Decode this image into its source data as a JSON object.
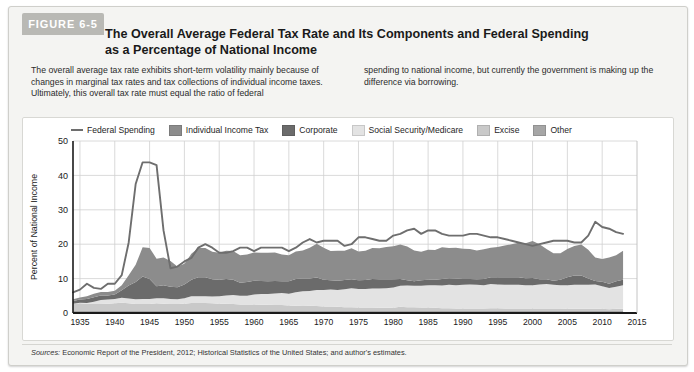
{
  "figure": {
    "tab_label": "FIGURE 6-5",
    "title": "The Overall Average Federal Tax Rate and Its Components and Federal Spending as a Percentage of National Income",
    "blurb_left": "The overall average tax rate exhibits short-term volatility mainly because of changes in marginal tax rates and tax collections of individual income taxes. Ultimately, this overall tax rate must equal the ratio of federal",
    "blurb_right": "spending to national income, but currently the government is making up the difference via borrowing.",
    "source_prefix": "Sources:",
    "source_text": " Economic Report of the President, 2012; Historical Statistics of the United States; and author's estimates."
  },
  "colors": {
    "federal_spending_line": "#6e6e6e",
    "individual_income_tax": "#8c8c8c",
    "corporate": "#6b6b6b",
    "social_security_medicare": "#e3e3e3",
    "excise": "#c9c9c9",
    "other": "#a6a6a6",
    "grid": "#d0d0d0",
    "axis": "#1a1a1a",
    "card_background": "#f4f4f2",
    "tab_background": "#b9b9b5"
  },
  "chart_data": {
    "type": "area",
    "title": "The Overall Average Federal Tax Rate and Its Components and Federal Spending as a Percentage of National Income",
    "xlabel": "",
    "ylabel": "Percent of National Income",
    "xlim": [
      1934,
      2015
    ],
    "ylim": [
      0,
      50
    ],
    "ytick_values": [
      0,
      10,
      20,
      30,
      40,
      50
    ],
    "ytick_labels": [
      "0",
      "10",
      "20",
      "30",
      "40",
      "50"
    ],
    "xtick_values": [
      1935,
      1940,
      1945,
      1950,
      1955,
      1960,
      1965,
      1970,
      1975,
      1980,
      1985,
      1990,
      1995,
      2000,
      2005,
      2010,
      2015
    ],
    "xtick_labels": [
      "1935",
      "1940",
      "1945",
      "1950",
      "1955",
      "1960",
      "1965",
      "1970",
      "1975",
      "1980",
      "1985",
      "1990",
      "1995",
      "2000",
      "2005",
      "2010",
      "2015"
    ],
    "grid": true,
    "legend_position": "top",
    "stacked": true,
    "stack_order": [
      "other",
      "excise",
      "social_security_medicare",
      "corporate",
      "individual_income_tax"
    ],
    "x": [
      1934,
      1935,
      1936,
      1937,
      1938,
      1939,
      1940,
      1941,
      1942,
      1943,
      1944,
      1945,
      1946,
      1947,
      1948,
      1949,
      1950,
      1951,
      1952,
      1953,
      1954,
      1955,
      1956,
      1957,
      1958,
      1959,
      1960,
      1961,
      1962,
      1963,
      1964,
      1965,
      1966,
      1967,
      1968,
      1969,
      1970,
      1971,
      1972,
      1973,
      1974,
      1975,
      1976,
      1977,
      1978,
      1979,
      1980,
      1981,
      1982,
      1983,
      1984,
      1985,
      1986,
      1987,
      1988,
      1989,
      1990,
      1991,
      1992,
      1993,
      1994,
      1995,
      1996,
      1997,
      1998,
      1999,
      2000,
      2001,
      2002,
      2003,
      2004,
      2005,
      2006,
      2007,
      2008,
      2009,
      2010,
      2011,
      2012,
      2013
    ],
    "series": [
      {
        "name": "Federal Spending",
        "kind": "line",
        "color": "#6e6e6e",
        "values": [
          6.0,
          6.8,
          8.5,
          7.3,
          7.0,
          8.5,
          8.5,
          11.0,
          20.5,
          37.5,
          43.8,
          43.8,
          43.0,
          24.0,
          13.0,
          13.5,
          15.0,
          16.0,
          19.0,
          20.0,
          19.0,
          17.5,
          17.5,
          18.0,
          19.0,
          19.0,
          18.0,
          19.0,
          19.0,
          19.0,
          19.0,
          18.0,
          19.0,
          20.5,
          21.5,
          20.5,
          21.0,
          21.0,
          21.0,
          19.5,
          20.0,
          22.0,
          22.0,
          21.5,
          21.0,
          21.0,
          22.5,
          23.0,
          24.0,
          24.5,
          23.0,
          24.0,
          24.0,
          23.0,
          22.5,
          22.5,
          22.5,
          23.0,
          23.0,
          22.5,
          22.0,
          22.0,
          21.5,
          21.0,
          20.5,
          20.0,
          19.5,
          20.0,
          20.5,
          21.0,
          21.0,
          21.0,
          20.5,
          20.5,
          22.5,
          26.5,
          25.0,
          24.5,
          23.5,
          23.0
        ]
      },
      {
        "name": "Individual Income Tax",
        "kind": "area",
        "color": "#8c8c8c",
        "values": [
          0.5,
          0.6,
          0.8,
          1.0,
          1.0,
          1.0,
          1.1,
          1.5,
          3.0,
          5.0,
          8.5,
          9.0,
          8.0,
          8.0,
          7.5,
          6.0,
          6.0,
          7.5,
          8.5,
          8.5,
          8.0,
          7.8,
          8.2,
          8.3,
          8.0,
          8.0,
          8.2,
          8.2,
          8.3,
          8.3,
          7.8,
          7.6,
          8.0,
          8.2,
          9.0,
          9.8,
          9.3,
          8.5,
          8.7,
          8.5,
          9.0,
          8.4,
          8.5,
          9.0,
          9.0,
          9.4,
          9.6,
          10.0,
          9.8,
          9.0,
          8.3,
          8.7,
          8.6,
          9.2,
          8.8,
          9.0,
          8.8,
          8.7,
          8.4,
          8.6,
          8.6,
          8.8,
          9.2,
          9.6,
          10.0,
          10.2,
          10.7,
          10.2,
          8.8,
          8.0,
          7.7,
          8.2,
          8.6,
          9.0,
          8.4,
          6.8,
          6.6,
          7.6,
          7.6,
          8.4
        ]
      },
      {
        "name": "Corporate",
        "kind": "area",
        "color": "#6b6b6b",
        "values": [
          0.8,
          0.9,
          1.2,
          1.3,
          1.3,
          1.2,
          1.3,
          2.2,
          3.8,
          5.0,
          6.5,
          5.8,
          3.5,
          3.8,
          3.5,
          3.5,
          4.0,
          4.8,
          5.5,
          5.5,
          5.0,
          4.8,
          4.8,
          4.5,
          3.8,
          4.0,
          4.0,
          3.8,
          3.7,
          3.6,
          3.4,
          3.6,
          3.9,
          3.7,
          3.6,
          3.6,
          3.0,
          2.7,
          2.7,
          2.7,
          2.6,
          2.5,
          2.6,
          2.8,
          2.7,
          2.6,
          2.4,
          2.0,
          1.5,
          1.3,
          1.6,
          1.6,
          1.6,
          1.9,
          1.9,
          1.9,
          1.7,
          1.6,
          1.6,
          1.8,
          2.0,
          2.1,
          2.2,
          2.2,
          2.2,
          2.0,
          2.1,
          1.5,
          1.4,
          1.2,
          1.6,
          2.3,
          2.7,
          2.7,
          1.8,
          1.0,
          1.3,
          1.2,
          1.6,
          1.6
        ]
      },
      {
        "name": "Social Security/Medicare",
        "kind": "area",
        "color": "#e3e3e3",
        "values": [
          0.1,
          0.2,
          0.2,
          0.7,
          1.2,
          1.2,
          1.3,
          1.4,
          1.4,
          1.4,
          1.5,
          1.5,
          1.5,
          1.6,
          1.5,
          1.4,
          1.6,
          2.0,
          2.0,
          2.0,
          2.0,
          2.2,
          2.4,
          2.6,
          2.5,
          2.5,
          2.9,
          3.1,
          3.1,
          3.4,
          3.5,
          3.4,
          3.9,
          4.3,
          4.3,
          4.7,
          4.8,
          4.9,
          4.9,
          5.2,
          5.5,
          5.4,
          5.4,
          5.5,
          5.6,
          5.7,
          5.9,
          6.1,
          6.3,
          6.2,
          6.3,
          6.5,
          6.6,
          6.6,
          6.8,
          6.8,
          6.9,
          7.0,
          6.9,
          6.8,
          7.0,
          6.9,
          6.9,
          6.9,
          6.9,
          6.8,
          6.8,
          7.0,
          7.1,
          6.9,
          6.8,
          6.9,
          7.0,
          7.0,
          7.0,
          7.1,
          6.6,
          6.2,
          6.4,
          6.9
        ]
      },
      {
        "name": "Excise",
        "kind": "area",
        "color": "#c9c9c9",
        "values": [
          2.0,
          2.2,
          2.1,
          2.0,
          2.0,
          2.1,
          2.2,
          2.4,
          2.2,
          2.0,
          2.0,
          2.0,
          2.2,
          2.1,
          2.0,
          2.0,
          2.1,
          2.3,
          2.3,
          2.3,
          2.2,
          2.1,
          2.1,
          2.0,
          1.9,
          1.9,
          1.9,
          1.8,
          1.8,
          1.7,
          1.7,
          1.6,
          1.5,
          1.4,
          1.5,
          1.4,
          1.3,
          1.3,
          1.2,
          1.1,
          1.1,
          1.0,
          1.0,
          1.0,
          0.9,
          0.9,
          0.9,
          1.2,
          1.1,
          1.1,
          1.0,
          1.0,
          0.9,
          0.8,
          0.8,
          0.7,
          0.7,
          0.7,
          0.7,
          0.7,
          0.8,
          0.8,
          0.7,
          0.7,
          0.7,
          0.7,
          0.7,
          0.7,
          0.7,
          0.7,
          0.7,
          0.6,
          0.6,
          0.6,
          0.6,
          0.6,
          0.6,
          0.5,
          0.6,
          0.6
        ]
      },
      {
        "name": "Other",
        "kind": "area",
        "color": "#a6a6a6",
        "values": [
          0.6,
          0.6,
          0.6,
          0.6,
          0.6,
          0.6,
          0.6,
          0.6,
          0.6,
          0.6,
          0.6,
          0.6,
          0.6,
          0.6,
          0.6,
          0.6,
          0.6,
          0.6,
          0.6,
          0.6,
          0.6,
          0.6,
          0.6,
          0.6,
          0.6,
          0.6,
          0.6,
          0.6,
          0.6,
          0.6,
          0.6,
          0.6,
          0.6,
          0.6,
          0.6,
          0.6,
          0.6,
          0.6,
          0.6,
          0.6,
          0.6,
          0.6,
          0.6,
          0.6,
          0.6,
          0.6,
          0.6,
          0.6,
          0.6,
          0.6,
          0.6,
          0.6,
          0.6,
          0.6,
          0.6,
          0.6,
          0.6,
          0.6,
          0.6,
          0.6,
          0.6,
          0.6,
          0.6,
          0.6,
          0.6,
          0.6,
          0.6,
          0.6,
          0.6,
          0.6,
          0.6,
          0.6,
          0.6,
          0.6,
          0.6,
          0.6,
          0.6,
          0.6,
          0.6,
          0.6
        ]
      }
    ],
    "legend": [
      {
        "label": "Federal Spending",
        "swatch": "line",
        "color": "#6e6e6e"
      },
      {
        "label": "Individual Income Tax",
        "swatch": "box",
        "color": "#8c8c8c"
      },
      {
        "label": "Corporate",
        "swatch": "box",
        "color": "#6b6b6b"
      },
      {
        "label": "Social Security/Medicare",
        "swatch": "box",
        "color": "#e3e3e3"
      },
      {
        "label": "Excise",
        "swatch": "box",
        "color": "#c9c9c9"
      },
      {
        "label": "Other",
        "swatch": "box",
        "color": "#a6a6a6"
      }
    ]
  }
}
